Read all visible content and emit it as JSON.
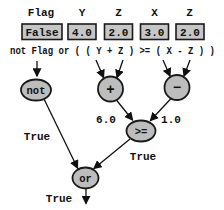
{
  "diagram": {
    "variables": [
      {
        "name": "Flag",
        "value": "False"
      },
      {
        "name": "Y",
        "value": "4.0"
      },
      {
        "name": "Z",
        "value": "2.0"
      },
      {
        "name": "X",
        "value": "3.0"
      },
      {
        "name": "Z",
        "value": "2.0"
      }
    ],
    "expression": "not Flag or ( ( Y + Z ) >= ( X - Z ) )",
    "nodes": {
      "not": {
        "label": "not",
        "result": "True"
      },
      "plus": {
        "label": "+",
        "result": "6.0"
      },
      "minus": {
        "label": "−",
        "result": "1.0"
      },
      "gte": {
        "label": ">=",
        "result": "True"
      },
      "or": {
        "label": "or",
        "result": "True"
      }
    },
    "colors": {
      "background": "#ffffff",
      "box_fill": "#c6c6c6",
      "node_fill": "#bdbdbd",
      "stroke": "#1a1a1a",
      "text": "#111111"
    }
  }
}
